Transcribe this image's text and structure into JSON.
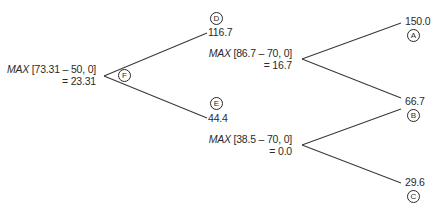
{
  "diagram": {
    "type": "binomial-option-tree",
    "line_color": "#3a3a3a",
    "nodes": {
      "A": {
        "label": "A",
        "value": "150.0"
      },
      "B": {
        "label": "B",
        "value": "66.7"
      },
      "C": {
        "label": "C",
        "value": "29.6"
      },
      "D": {
        "label": "D",
        "value": "116.7",
        "formula_func": "MAX",
        "formula_args": "[86.7 – 70, 0]",
        "result": "= 16.7"
      },
      "E": {
        "label": "E",
        "value": "44.4",
        "formula_func": "MAX",
        "formula_args": "[38.5 – 70, 0]",
        "result": "= 0.0"
      },
      "F": {
        "label": "F",
        "formula_func": "MAX",
        "formula_args": "[73.31 – 50, 0]",
        "result": "= 23.31"
      }
    },
    "edges": [
      {
        "from": "F",
        "to": "D"
      },
      {
        "from": "F",
        "to": "E"
      },
      {
        "from": "D",
        "to": "A"
      },
      {
        "from": "D",
        "to": "B"
      },
      {
        "from": "E",
        "to": "B"
      },
      {
        "from": "E",
        "to": "C"
      }
    ]
  }
}
